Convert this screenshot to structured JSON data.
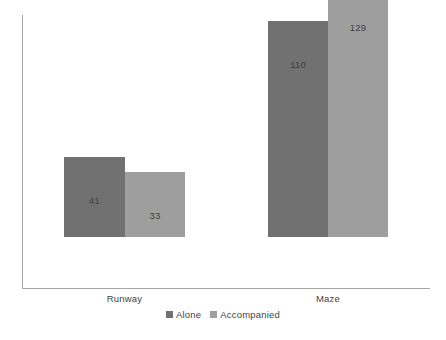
{
  "chart_data": {
    "type": "bar",
    "title": "",
    "subtitle": "",
    "xlabel": "",
    "ylabel": "",
    "categories": [
      "Runway",
      "Maze"
    ],
    "series": [
      {
        "name": "Alone",
        "values": [
          41,
          110
        ],
        "color": "#717171"
      },
      {
        "name": "Accompanied",
        "values": [
          33,
          129
        ],
        "color": "#9e9e9e"
      }
    ],
    "value_labels": {
      "runway_alone": "41",
      "runway_accompanied": "33",
      "maze_alone": "110",
      "maze_accompanied": "129"
    },
    "ylim": [
      0,
      129
    ],
    "grid": false,
    "y_axis_ticks_visible": false,
    "legend_position": "bottom-center",
    "axis_color": "#a6a6a6",
    "text_color": "#3f3f3f",
    "background": "#ffffff"
  },
  "legend": {
    "items": [
      {
        "label": "Alone",
        "color": "#717171"
      },
      {
        "label": "Accompanied",
        "color": "#9e9e9e"
      }
    ]
  },
  "axis": {
    "categories": [
      {
        "label": "Runway"
      },
      {
        "label": "Maze"
      }
    ]
  }
}
